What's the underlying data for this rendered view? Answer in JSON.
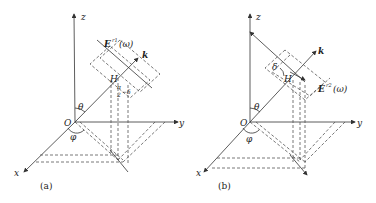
{
  "figure": {
    "panels": [
      {
        "id": "a",
        "caption": "(a)",
        "axes": {
          "x": "x",
          "y": "y",
          "z": "z"
        },
        "origin": "O",
        "angles": {
          "polar": "θ",
          "azimuth": "φ",
          "tilt": "π/2 − δ",
          "tilt_num": "π",
          "tilt_den": "2",
          "tilt_rest": "−δ"
        },
        "field_label": "E",
        "field_sup": "r1",
        "field_arg": "(ω)",
        "wave_vector": "k",
        "point": "H"
      },
      {
        "id": "b",
        "caption": "(b)",
        "axes": {
          "x": "x",
          "y": "y",
          "z": "z"
        },
        "origin": "O",
        "angles": {
          "polar": "θ",
          "azimuth": "φ",
          "tilt": "δ"
        },
        "field_label": "E",
        "field_sup": "r2",
        "field_arg": "(ω)",
        "wave_vector": "k",
        "point": "H"
      }
    ],
    "colors": {
      "line": "#333333",
      "dash": "#555555",
      "background": "#ffffff"
    }
  }
}
